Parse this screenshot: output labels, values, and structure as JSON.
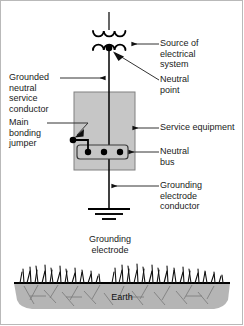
{
  "diagram": {
    "colors": {
      "line": "#000000",
      "equipment_fill": "#c6c6c6",
      "equipment_stroke": "#808080",
      "earth_fill": "#b5b5b5",
      "earth_stroke": "#000000",
      "leader": "#444444",
      "text": "#1a1a1a",
      "background": "#ffffff"
    },
    "labels": {
      "source_of_electrical_system": "Source of\nelectrical\nsystem",
      "neutral_point": "Neutral\npoint",
      "grounded_neutral_service_conductor": "Grounded\nneutral\nservice\nconductor",
      "main_bonding_jumper": "Main\nbonding\njumper",
      "service_equipment": "Service equipment",
      "neutral_bus": "Neutral\nbus",
      "grounding_electrode_conductor": "Grounding\nelectrode\nconductor",
      "grounding_electrode": "Grounding\nelectrode",
      "earth": "Earth"
    },
    "components": {
      "transformer_primary_arcs": 3,
      "transformer_secondary_arcs": 3,
      "neutral_bus_terminals": 3,
      "ground_symbol_bars": 3
    }
  }
}
